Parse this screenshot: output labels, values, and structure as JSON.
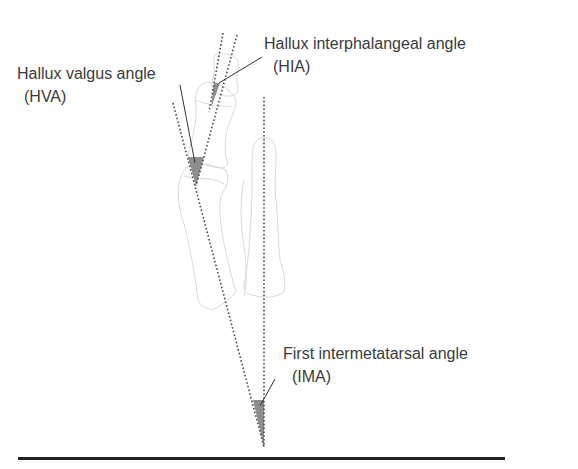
{
  "figure": {
    "labels": {
      "hva": {
        "name": "Hallux valgus angle",
        "abbr": "(HVA)"
      },
      "hia": {
        "name": "Hallux interphalangeal angle",
        "abbr": "(HIA)"
      },
      "ima": {
        "name": "First intermetatarsal angle",
        "abbr": "(IMA)"
      }
    },
    "colors": {
      "bone_outline": "#d8d8d8",
      "dotted_line": "#444444",
      "angle_fill": "#8a8a8a",
      "leader_line": "#333333",
      "text": "#3a3a3a",
      "rule": "#222222"
    }
  }
}
